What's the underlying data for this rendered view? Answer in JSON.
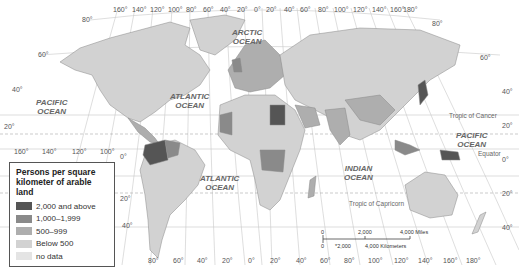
{
  "map": {
    "title": "Persons per square kilometer of arable land",
    "legend": {
      "title_line1": "Persons per square",
      "title_line2": "kilometer of arable land",
      "items": [
        {
          "label": "2,000 and above",
          "color": "#555555"
        },
        {
          "label": "1,000–1,999",
          "color": "#8a8a8a"
        },
        {
          "label": "500–999",
          "color": "#aeaeae"
        },
        {
          "label": "Below 500",
          "color": "#d2d2d2"
        },
        {
          "label": "no data",
          "color": "#e4e4e4"
        }
      ]
    },
    "oceans": [
      {
        "line1": "ARCTIC",
        "line2": "OCEAN"
      },
      {
        "line1": "PACIFIC",
        "line2": "OCEAN"
      },
      {
        "line1": "ATLANTIC",
        "line2": "OCEAN"
      },
      {
        "line1": "ATLANTIC",
        "line2": "OCEAN"
      },
      {
        "line1": "INDIAN",
        "line2": "OCEAN"
      },
      {
        "line1": "PACIFIC",
        "line2": "OCEAN"
      }
    ],
    "reference_lines": {
      "tropic_cancer": "Tropic of Cancer",
      "equator": "Equator",
      "tropic_capricorn": "Tropic of Capricorn"
    },
    "top_longitudes": [
      "160°",
      "140°",
      "120°",
      "100°",
      "80°",
      "60°",
      "40°",
      "20°",
      "0°",
      "20°",
      "40°",
      "60°",
      "80°",
      "100°",
      "120°",
      "140°",
      "160°",
      "180°"
    ],
    "bottom_longitudes": [
      "80°",
      "60°",
      "40°",
      "20°",
      "0°",
      "20°",
      "40°",
      "60°",
      "80°",
      "100°",
      "120°",
      "140°",
      "160°",
      "180°"
    ],
    "left_latitudes": [
      "80°",
      "60°",
      "40°",
      "20°",
      "0°",
      "20°",
      "40°",
      "60°"
    ],
    "mid_longitudes": [
      "160°",
      "140°",
      "120°",
      "100°"
    ],
    "right_latitudes": [
      "80°",
      "60°",
      "40°",
      "20°",
      "0°",
      "20°",
      "40°"
    ],
    "scale": {
      "miles_0": "0",
      "miles_mid": "2,000",
      "miles_end": "4,000 Miles",
      "km_0": "0",
      "km_mid": "*2,000",
      "km_end": "4,000 Kilometers"
    }
  }
}
